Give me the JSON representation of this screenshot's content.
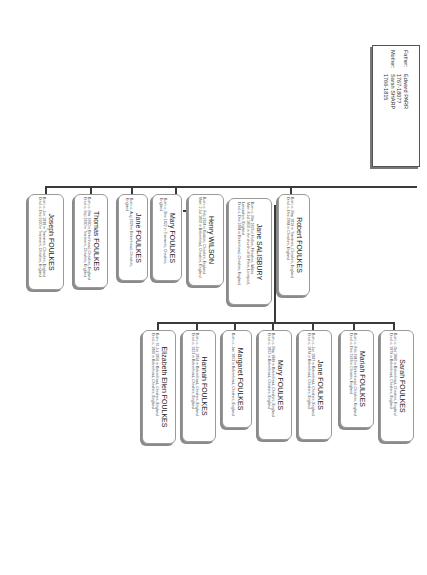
{
  "parents": {
    "father_label": "Father:",
    "father_name": "Edward PARR",
    "father_dates": "1767-1807?",
    "mother_label": "Mother:",
    "mother_name": "Sarah SHARP",
    "mother_dates": "1766-1815"
  },
  "children": [
    {
      "name": "Robert FOULKES",
      "lines": [
        "Born: c. May 1819 in Tranmere, Cheshire, England",
        "Died: c. Dec 1884 in Cheshire, England"
      ]
    },
    {
      "name": "Jane SALISBURY",
      "lines": [
        "Born: c. Mar 1826 in Holton, Flintshire, Wales",
        "Marr: 8 Jul 1850 in the church of St Peter, Liverpool, Lancashire, England",
        "Died: c. Dec 1884 in Birkenhead, Cheshire, England"
      ]
    },
    {
      "name": "Henry WILSON",
      "lines": [
        "Born: c. Feb 1824 in Bidston, Cheshire, England",
        "Marr: 2 Jul 1850 in Birkenhead, Cheshire, England"
      ]
    },
    {
      "name": "Mary FOULKES",
      "lines": [
        "Born: c. Dec 1822 in Tranmere, Cheshire, England"
      ]
    },
    {
      "name": "Jane FOULKES",
      "lines": [
        "Born: c. Aug 1828 in Birkenhead, Cheshire, England"
      ]
    },
    {
      "name": "Thomas FOULKES",
      "lines": [
        "Born: c. Mar 1830 in Birkenhead, Cheshire, England",
        "Died: c. Sep 1830 in Tranmere, Cheshire, England"
      ]
    },
    {
      "name": "Joseph FOULKES",
      "lines": [
        "Born: c. Jun 1838 in Tranmere, Cheshire, England",
        "Died: c. Dec 1920 in Tranmere, Cheshire, England"
      ]
    }
  ],
  "grandchildren": [
    {
      "name": "Sarah FOULKES",
      "lines": [
        "Born: c. Oct 1840 in Birkenhead, Cheshire, England",
        "Died: c. 1879 in Birkenhead, Cheshire, England"
      ]
    },
    {
      "name": "Mariah FOULKES",
      "lines": [
        "Born: c. Feb 1843 in Birkenhead, Cheshire, England",
        "Died: c. Dec 1918 in Chester, England"
      ]
    },
    {
      "name": "Jane FOULKES",
      "lines": [
        "Born: c. Jun 1847 in Birkenhead, Cheshire, England",
        "Died: c. 1874 in Birkenhead, Cheshire, England"
      ]
    },
    {
      "name": "Mary FOULKES",
      "lines": [
        "Born: c. May 1849 in Birkenhead, Cheshire, England",
        "Died: c. 1852 in Birkenhead, Cheshire, England"
      ]
    },
    {
      "name": "Margaret FOULKES",
      "lines": [
        "Born: c. Jan 1853 in Birkenhead, Cheshire, England"
      ]
    },
    {
      "name": "Hannah FOULKES",
      "lines": [
        "Born: c. Jun 1854 in Birkenhead, Cheshire, England",
        "Died: c. 1923 in Birkenhead, Cheshire, England"
      ]
    },
    {
      "name": "Elizabeth Ellen FOULKES",
      "lines": [
        "Born: 31 Jul 1856 in Birkenhead, Cheshire, England",
        "Died: c. 1860 in Birkenhead, Cheshire, England"
      ]
    }
  ]
}
